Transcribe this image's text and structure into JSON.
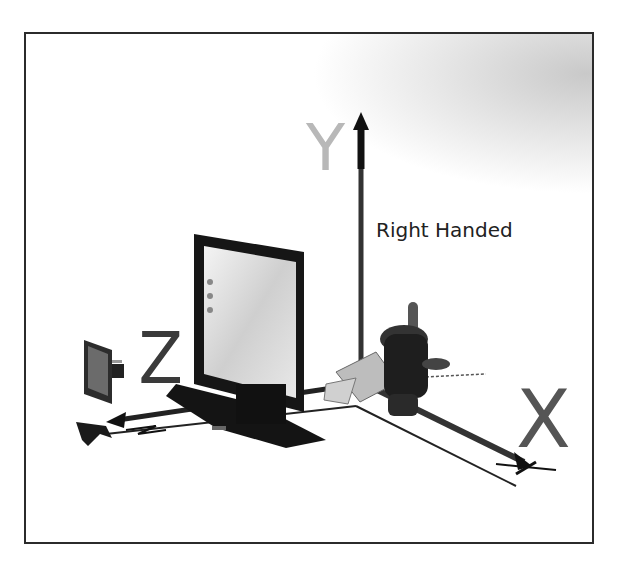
{
  "diagram": {
    "caption": "Right Handed",
    "axes": [
      {
        "name": "Y",
        "label": "Y",
        "color": "#b8b8b8",
        "direction": "up"
      },
      {
        "name": "Z",
        "label": "Z",
        "color": "#3a3a3a",
        "direction": "toward-viewer-left"
      },
      {
        "name": "X",
        "label": "X",
        "color": "#555555",
        "direction": "right-down"
      }
    ],
    "objects": [
      "monitor",
      "camera",
      "hand-model"
    ],
    "colors": {
      "frame": "#2b2b2b",
      "background": "#ffffff",
      "shadow": "#c9c9c9"
    }
  }
}
